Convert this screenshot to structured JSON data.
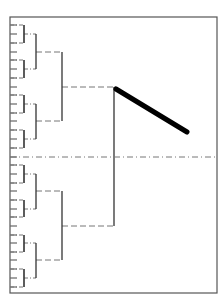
{
  "diagram": {
    "type": "hierarchical-bracket-tree",
    "frame": {
      "x": 10,
      "y": 17,
      "width": 207,
      "height": 276,
      "color": "#555555"
    },
    "leaf_ticks": {
      "x1": 10,
      "x2": 17,
      "y_values": [
        25,
        34,
        43,
        52,
        60,
        69,
        78,
        87,
        95,
        104,
        113,
        121,
        130,
        139,
        148,
        157,
        165,
        174,
        183,
        191,
        200,
        209,
        217,
        226,
        235,
        243,
        252,
        260,
        269,
        278,
        287
      ],
      "color": "#666666"
    },
    "brackets": [
      {
        "level": 1,
        "x": 24,
        "y1": 25,
        "y2": 43,
        "mid": 34
      },
      {
        "level": 1,
        "x": 24,
        "y1": 60,
        "y2": 78,
        "mid": 69
      },
      {
        "level": 1,
        "x": 24,
        "y1": 95,
        "y2": 113,
        "mid": 104
      },
      {
        "level": 1,
        "x": 24,
        "y1": 130,
        "y2": 148,
        "mid": 139
      },
      {
        "level": 1,
        "x": 24,
        "y1": 165,
        "y2": 183,
        "mid": 174
      },
      {
        "level": 1,
        "x": 24,
        "y1": 200,
        "y2": 217,
        "mid": 209
      },
      {
        "level": 1,
        "x": 24,
        "y1": 235,
        "y2": 252,
        "mid": 243
      },
      {
        "level": 1,
        "x": 24,
        "y1": 269,
        "y2": 287,
        "mid": 278
      },
      {
        "level": 2,
        "x": 36,
        "y1": 34,
        "y2": 69,
        "mid": 52
      },
      {
        "level": 2,
        "x": 36,
        "y1": 104,
        "y2": 139,
        "mid": 121
      },
      {
        "level": 2,
        "x": 36,
        "y1": 174,
        "y2": 209,
        "mid": 191
      },
      {
        "level": 2,
        "x": 36,
        "y1": 243,
        "y2": 278,
        "mid": 260
      },
      {
        "level": 3,
        "x": 62,
        "y1": 52,
        "y2": 121,
        "mid": 87
      },
      {
        "level": 3,
        "x": 62,
        "y1": 191,
        "y2": 260,
        "mid": 226
      },
      {
        "level": 4,
        "x": 114,
        "y1": 87,
        "y2": 226,
        "mid": 157
      }
    ],
    "root_line": {
      "y": 157,
      "x1": 10,
      "x2": 217
    },
    "thick_stroke": {
      "x1": 116,
      "y1": 89,
      "x2": 187,
      "y2": 132,
      "color": "#000000",
      "width": 5
    },
    "colors": {
      "bracket": "#333333",
      "dash": "#777777"
    }
  }
}
